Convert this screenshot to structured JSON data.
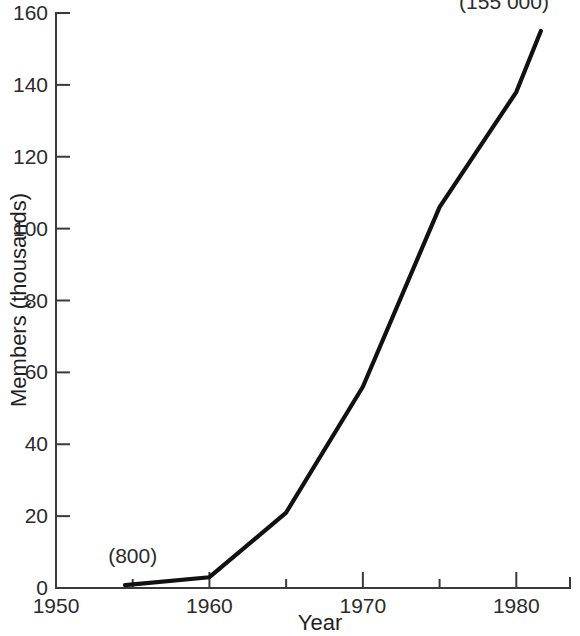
{
  "chart_data": {
    "type": "line",
    "title": "",
    "xlabel": "Year",
    "ylabel": "Members (thousands)",
    "xlim": [
      1950,
      1983.5
    ],
    "ylim": [
      0,
      160
    ],
    "grid": false,
    "legend": "none",
    "x_ticks_major": [
      1950,
      1960,
      1970,
      1980
    ],
    "x_tick_labels": [
      "1950",
      "1960",
      "1970",
      "1980"
    ],
    "x_ticks_minor": [
      1955,
      1965,
      1975
    ],
    "y_ticks_major": [
      0,
      20,
      40,
      60,
      80,
      100,
      120,
      140,
      160
    ],
    "y_tick_labels": [
      "0",
      "20",
      "40",
      "60",
      "80",
      "100",
      "120",
      "140",
      "160"
    ],
    "series": [
      {
        "name": "Members",
        "x": [
          1954.5,
          1960,
          1965,
          1970,
          1975,
          1980,
          1981.6
        ],
        "values": [
          0.8,
          3,
          21,
          56,
          106,
          138,
          155
        ]
      }
    ],
    "annotations": [
      {
        "name": "start-value-annotation",
        "text": "(800)",
        "x": 1955,
        "y": 7
      },
      {
        "name": "end-value-annotation",
        "text": "(155 000)",
        "x": 1979.2,
        "y": 161
      }
    ],
    "colors": {
      "line": "#111111",
      "axis": "#3a3a3a",
      "text": "#2b2b2b",
      "background": "#ffffff"
    }
  },
  "axis": {
    "x_label": "Year",
    "y_label": "Members (thousands)"
  }
}
